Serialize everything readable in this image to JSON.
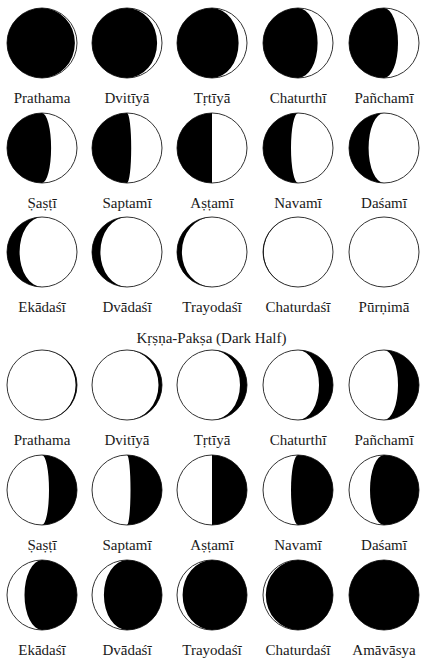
{
  "figure": {
    "sections": [
      {
        "name": "Śukla-Pakṣa (Bright Half)",
        "heading_visible": false,
        "phases": [
          {
            "label": "Prathama",
            "lit": 0.03,
            "lit_side": "right"
          },
          {
            "label": "Dvitīyā",
            "lit": 0.07,
            "lit_side": "right"
          },
          {
            "label": "Tṛtīyā",
            "lit": 0.12,
            "lit_side": "right"
          },
          {
            "label": "Chaturthī",
            "lit": 0.22,
            "lit_side": "right"
          },
          {
            "label": "Pañchamī",
            "lit": 0.3,
            "lit_side": "right"
          },
          {
            "label": "Ṣaṣṭī",
            "lit": 0.37,
            "lit_side": "right"
          },
          {
            "label": "Saptamī",
            "lit": 0.44,
            "lit_side": "right"
          },
          {
            "label": "Aṣṭamī",
            "lit": 0.5,
            "lit_side": "right"
          },
          {
            "label": "Navamī",
            "lit": 0.6,
            "lit_side": "right"
          },
          {
            "label": "Daśamī",
            "lit": 0.72,
            "lit_side": "right"
          },
          {
            "label": "Ekādaśī",
            "lit": 0.82,
            "lit_side": "right"
          },
          {
            "label": "Dvādaśī",
            "lit": 0.88,
            "lit_side": "right"
          },
          {
            "label": "Trayodaśī",
            "lit": 0.93,
            "lit_side": "right"
          },
          {
            "label": "Chaturdaśī",
            "lit": 0.99,
            "lit_side": "right"
          },
          {
            "label": "Pūrṇimā",
            "lit": 1.0,
            "lit_side": "right"
          }
        ]
      },
      {
        "name": "Kṛṣṇa-Pakṣa (Dark Half)",
        "heading_visible": true,
        "phases": [
          {
            "label": "Prathama",
            "lit": 0.98,
            "lit_side": "left"
          },
          {
            "label": "Dvitīyā",
            "lit": 0.95,
            "lit_side": "left"
          },
          {
            "label": "Tṛtīyā",
            "lit": 0.9,
            "lit_side": "left"
          },
          {
            "label": "Chaturthī",
            "lit": 0.8,
            "lit_side": "left"
          },
          {
            "label": "Pañchamī",
            "lit": 0.7,
            "lit_side": "left"
          },
          {
            "label": "Ṣaṣṭī",
            "lit": 0.6,
            "lit_side": "left"
          },
          {
            "label": "Saptamī",
            "lit": 0.55,
            "lit_side": "left"
          },
          {
            "label": "Aṣṭamī",
            "lit": 0.5,
            "lit_side": "left"
          },
          {
            "label": "Navamī",
            "lit": 0.4,
            "lit_side": "left"
          },
          {
            "label": "Daśamī",
            "lit": 0.3,
            "lit_side": "left"
          },
          {
            "label": "Ekādaśī",
            "lit": 0.25,
            "lit_side": "left"
          },
          {
            "label": "Dvādaśī",
            "lit": 0.17,
            "lit_side": "left"
          },
          {
            "label": "Trayodaśī",
            "lit": 0.08,
            "lit_side": "left"
          },
          {
            "label": "Chaturdaśī",
            "lit": 0.04,
            "lit_side": "left"
          },
          {
            "label": "Amāvāsya",
            "lit": 0.0,
            "lit_side": "left"
          }
        ]
      }
    ],
    "colors": {
      "dark": "#000000",
      "light": "#ffffff",
      "outline": "#333333",
      "text": "#1a1a1a"
    }
  }
}
